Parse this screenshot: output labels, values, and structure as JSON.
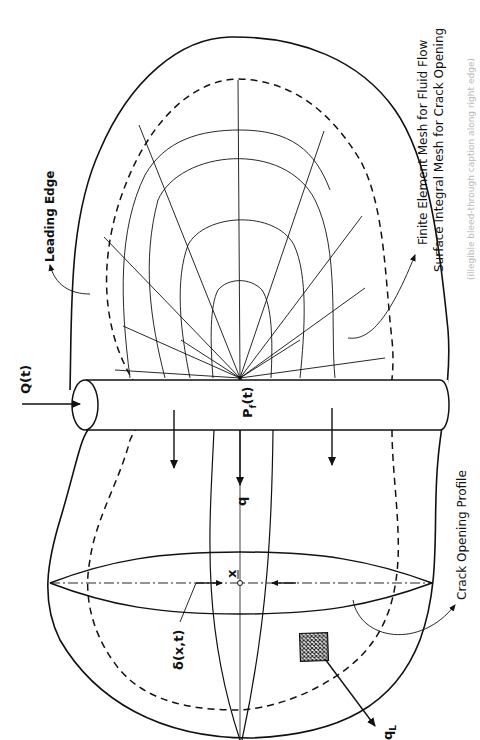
{
  "figure": {
    "orientation": "rotated 90 degrees clockwise (text reads bottom-to-top)",
    "labels": {
      "leading_edge": "Leading  Edge",
      "mesh_note_line1": "Finite  Element  Mesh  for  Fluid  Flow",
      "mesh_note_line2": "Surface  Integral  Mesh  for  Crack  Opening",
      "injection_rate": "Q(t)",
      "wellbore_pressure": "P",
      "wellbore_pressure_sub": "f",
      "wellbore_pressure_arg": "(t)",
      "flux": "q",
      "leakoff": "q",
      "leakoff_sub": "L",
      "crack_opening_profile": "Crack  Opening  Profile",
      "opening_function": "δ(x,t)",
      "position_vector": "x"
    },
    "caption_faint": "(illegible bleed-through caption along right edge)",
    "colors": {
      "ink": "#111111",
      "background": "#ffffff",
      "hatch": "#222222"
    }
  }
}
